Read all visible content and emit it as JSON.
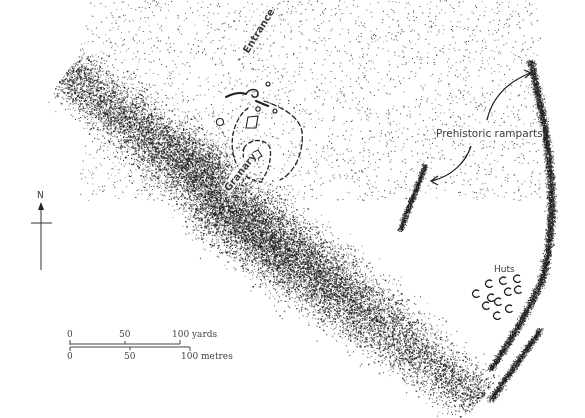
{
  "map": {
    "width": 585,
    "height": 418,
    "ink_color": "#222222",
    "labels": {
      "entrance": "Entrance",
      "granary": "Granary",
      "ramparts": "Prehistoric ramparts",
      "huts": "Huts",
      "north": "N"
    },
    "scale_bar": {
      "yards": {
        "ticks": [
          "0",
          "50",
          "100 yards"
        ]
      },
      "metres": {
        "ticks": [
          "0",
          "50",
          "100 metres"
        ]
      }
    },
    "icons": {
      "north_arrow": "north-arrow-icon",
      "rampart_arrows": "curved-arrow-icon"
    },
    "terrain": {
      "main_ridge": {
        "from": [
          60,
          80
        ],
        "to": [
          470,
          400
        ],
        "note": "dense diagonal stippled slope"
      },
      "rampart_east": {
        "note": "curved stippled bank along right edge"
      },
      "rampart_west": {
        "note": "short stippled bank near centre"
      }
    }
  }
}
